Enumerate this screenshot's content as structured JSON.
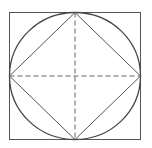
{
  "diagram": {
    "canvas": {
      "width": 152,
      "height": 148,
      "background": "#ffffff"
    },
    "colors": {
      "square_stroke": "#555555",
      "circle_stroke": "#444444",
      "diamond_stroke": "#555555",
      "dashed_stroke": "#666666"
    },
    "square": {
      "x": 9.5,
      "y": 12.5,
      "width": 131,
      "height": 127
    },
    "circle": {
      "cx": 75,
      "cy": 76,
      "rx": 65.5,
      "ry": 63.5
    },
    "diamond": {
      "top": [
        75,
        12.5
      ],
      "right": [
        140.5,
        76
      ],
      "bottom": [
        75,
        139.5
      ],
      "left": [
        9.5,
        76
      ]
    },
    "dashed_lines": [
      {
        "name": "vertical",
        "x1": 75,
        "y1": 12.5,
        "x2": 75,
        "y2": 139.5
      },
      {
        "name": "horizontal",
        "x1": 9.5,
        "y1": 76,
        "x2": 140.5,
        "y2": 76
      }
    ]
  }
}
